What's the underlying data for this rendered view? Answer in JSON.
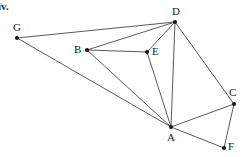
{
  "figure": {
    "item_marker": "iv.",
    "background_color": "#ffffff",
    "edge_color": "#5a5a5a",
    "vertex_color": "#1a1a1a",
    "width": 242,
    "height": 157
  },
  "chart_data": {
    "type": "scatter",
    "title": "",
    "xlabel": "",
    "ylabel": "",
    "grid": false,
    "legend": null,
    "xlim": [
      0,
      242
    ],
    "ylim": [
      157,
      0
    ],
    "graph": {
      "kind": "undirected-graph",
      "vertex_count": 7,
      "edge_count": 12,
      "vertices": [
        {
          "id": "G",
          "label": "G",
          "x": 17,
          "y": 38,
          "label_dx": -4,
          "label_dy": -16,
          "degree": 2
        },
        {
          "id": "B",
          "label": "B",
          "x": 87,
          "y": 50,
          "label_dx": -13,
          "label_dy": -6,
          "degree": 3
        },
        {
          "id": "D",
          "label": "D",
          "x": 175,
          "y": 22,
          "label_dx": -3,
          "label_dy": -16,
          "degree": 5
        },
        {
          "id": "E",
          "label": "E",
          "x": 147,
          "y": 52,
          "label_dx": 5,
          "label_dy": -6,
          "degree": 3
        },
        {
          "id": "A",
          "label": "A",
          "x": 171,
          "y": 127,
          "label_dx": -4,
          "label_dy": 5,
          "degree": 6
        },
        {
          "id": "C",
          "label": "C",
          "x": 234,
          "y": 104,
          "label_dx": -5,
          "label_dy": -17,
          "degree": 3
        },
        {
          "id": "F",
          "label": "F",
          "x": 224,
          "y": 148,
          "label_dx": 4,
          "label_dy": -7,
          "degree": 2
        }
      ],
      "edges": [
        {
          "from": "G",
          "to": "D"
        },
        {
          "from": "G",
          "to": "A"
        },
        {
          "from": "B",
          "to": "D"
        },
        {
          "from": "B",
          "to": "E"
        },
        {
          "from": "B",
          "to": "A"
        },
        {
          "from": "D",
          "to": "E"
        },
        {
          "from": "D",
          "to": "A"
        },
        {
          "from": "D",
          "to": "C"
        },
        {
          "from": "E",
          "to": "A"
        },
        {
          "from": "A",
          "to": "C"
        },
        {
          "from": "A",
          "to": "F"
        },
        {
          "from": "C",
          "to": "F"
        }
      ]
    }
  }
}
